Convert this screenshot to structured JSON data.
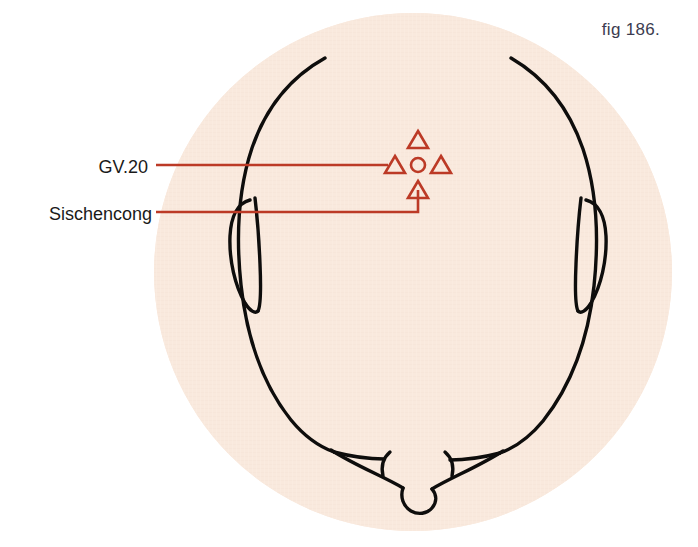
{
  "figure": {
    "caption": "fig 186.",
    "caption_color": "#3c3c50",
    "view": "top-of-head (vertex) view of a human head with acupuncture points"
  },
  "colors": {
    "background": "#ffffff",
    "halo_fill": "#f9e9dd",
    "outline_stroke": "#0e0d0c",
    "marker_stroke": "#bc3a26",
    "leader_stroke": "#bc3a26",
    "label_text": "#1a1a1a"
  },
  "labels": [
    {
      "id": "gv20",
      "text": "GV.20",
      "target": "center-circle-marker"
    },
    {
      "id": "sishencong",
      "text": "Sischencong",
      "target": "bottom-triangle-marker"
    }
  ],
  "markers": {
    "center_point": {
      "name": "GV.20",
      "shape": "circle",
      "cx": 418,
      "cy": 165,
      "r": 7
    },
    "surrounding_points": {
      "name": "Sischencong",
      "shape": "triangle",
      "count": 4,
      "positions": [
        {
          "position": "anterior",
          "cx": 418,
          "cy": 140
        },
        {
          "position": "left",
          "cx": 395,
          "cy": 165
        },
        {
          "position": "right",
          "cx": 441,
          "cy": 165
        },
        {
          "position": "posterior",
          "cx": 418,
          "cy": 190
        }
      ]
    }
  }
}
